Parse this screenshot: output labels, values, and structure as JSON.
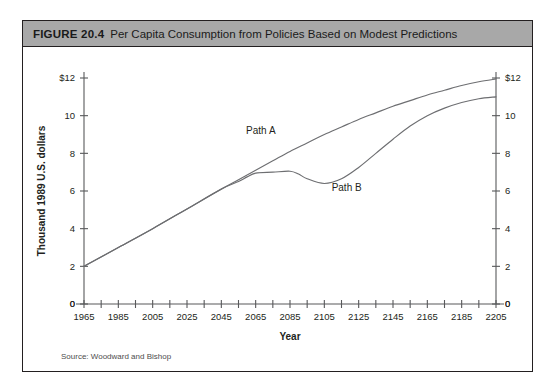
{
  "figure": {
    "number_label": "FIGURE 20.4",
    "title": "Per Capita Consumption from Policies Based on Modest Predictions",
    "source": "Source: Woodward and Bishop",
    "header_bg": "#a8a8a8",
    "border_color": "#231f20"
  },
  "chart_data": {
    "type": "line",
    "title": "Per Capita Consumption from Policies Based on Modest Predictions",
    "xlabel": "Year",
    "ylabel": "Thousand 1989 U.S. dollars",
    "xlim": [
      1965,
      2205
    ],
    "ylim": [
      0,
      12
    ],
    "grid": false,
    "legend": "inline-labels",
    "y_ticks": [
      0,
      2,
      4,
      6,
      8,
      10,
      12
    ],
    "y_tick_labels": [
      "0",
      "2",
      "4",
      "6",
      "8",
      "10",
      "$12"
    ],
    "y_tick_labels_right": [
      "0",
      "2",
      "4",
      "6",
      "8",
      "10",
      "$12"
    ],
    "x_ticks": [
      1965,
      1975,
      1985,
      1995,
      2005,
      2015,
      2025,
      2035,
      2045,
      2055,
      2065,
      2075,
      2085,
      2095,
      2105,
      2115,
      2125,
      2135,
      2145,
      2155,
      2165,
      2175,
      2185,
      2195,
      2205
    ],
    "x_tick_labels": [
      "1965",
      "",
      "1985",
      "",
      "2005",
      "",
      "2025",
      "",
      "2045",
      "",
      "2065",
      "",
      "2085",
      "",
      "2105",
      "",
      "2125",
      "",
      "2145",
      "",
      "2165",
      "",
      "2185",
      "",
      "2205"
    ],
    "x_origin_label": "0",
    "x_end_label": "0",
    "series": [
      {
        "name": "Path A",
        "label_x": 2068,
        "label_y": 9.05,
        "x": [
          1965,
          1985,
          2005,
          2025,
          2045,
          2055,
          2065,
          2075,
          2085,
          2095,
          2105,
          2115,
          2125,
          2135,
          2145,
          2155,
          2165,
          2175,
          2185,
          2195,
          2205
        ],
        "values": [
          2.0,
          3.0,
          4.0,
          5.05,
          6.1,
          6.6,
          7.1,
          7.6,
          8.1,
          8.55,
          9.0,
          9.4,
          9.8,
          10.15,
          10.5,
          10.8,
          11.1,
          11.35,
          11.6,
          11.8,
          11.95
        ]
      },
      {
        "name": "Path B",
        "label_x": 2118,
        "label_y": 6.0,
        "x": [
          1965,
          1985,
          2005,
          2025,
          2045,
          2055,
          2060,
          2065,
          2075,
          2085,
          2090,
          2095,
          2105,
          2115,
          2125,
          2135,
          2145,
          2155,
          2165,
          2175,
          2185,
          2195,
          2205
        ],
        "values": [
          2.0,
          3.0,
          4.0,
          5.05,
          6.1,
          6.5,
          6.75,
          6.95,
          7.0,
          7.05,
          6.9,
          6.65,
          6.4,
          6.65,
          7.25,
          8.0,
          8.75,
          9.45,
          10.0,
          10.4,
          10.7,
          10.9,
          11.0
        ]
      }
    ]
  }
}
